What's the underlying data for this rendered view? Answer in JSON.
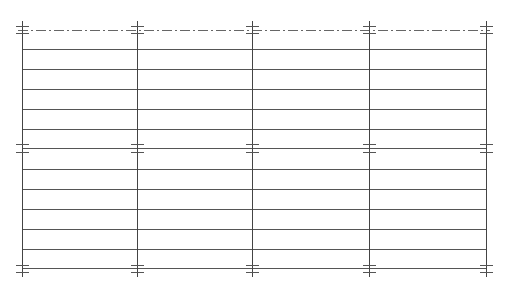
{
  "diagram": {
    "type": "cad-grid-plan",
    "canvas": {
      "width": 510,
      "height": 288,
      "background": "#ffffff"
    },
    "colors": {
      "line": "#555555",
      "grid_column": "#444444",
      "tick": "#555555",
      "centerline": "#666666"
    },
    "columns_x": [
      22,
      137,
      252,
      369,
      486
    ],
    "column_top_y": 21,
    "column_bottom_y": 277,
    "centerline": {
      "y": 30,
      "x1": 22,
      "x2": 486,
      "dash": "10 3 2 3"
    },
    "rows_y": [
      49,
      69,
      89,
      109,
      129,
      148,
      169,
      189,
      209,
      229,
      249,
      268
    ],
    "tick_groups": [
      {
        "name": "top",
        "y": [
          26,
          33
        ]
      },
      {
        "name": "middle",
        "y": [
          144,
          152
        ]
      },
      {
        "name": "bottom",
        "y": [
          265,
          272
        ]
      }
    ],
    "tick_half_width": 6
  }
}
